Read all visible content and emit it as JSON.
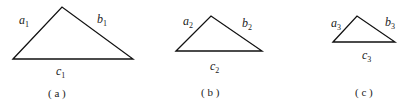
{
  "figures": [
    {
      "id": "a",
      "caption": "( a )",
      "sides": {
        "a": "a",
        "a_sub": "1",
        "b": "b",
        "b_sub": "1",
        "c": "c",
        "c_sub": "1"
      },
      "points": "13,59 62,7 133,59"
    },
    {
      "id": "b",
      "caption": "( b )",
      "sides": {
        "a": "a",
        "a_sub": "2",
        "b": "b",
        "b_sub": "2",
        "c": "c",
        "c_sub": "2"
      },
      "points": "176,51 211,16 262,51"
    },
    {
      "id": "c",
      "caption": "( c )",
      "sides": {
        "a": "a",
        "a_sub": "3",
        "b": "b",
        "b_sub": "3",
        "c": "c",
        "c_sub": "3"
      },
      "points": "333,42 357,16 395,42"
    }
  ]
}
